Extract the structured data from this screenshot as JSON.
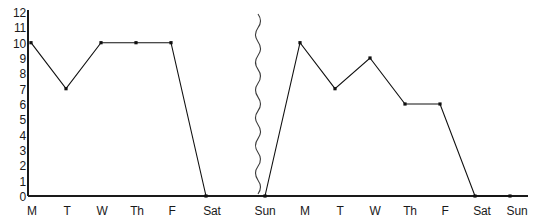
{
  "chart_data": {
    "type": "line",
    "title": "",
    "subtitle": "",
    "xlabel": "",
    "ylabel": "",
    "categories": [
      "M",
      "T",
      "W",
      "Th",
      "F",
      "Sat",
      "Sun",
      "M",
      "T",
      "W",
      "Th",
      "F",
      "Sat",
      "Sun"
    ],
    "values": [
      10,
      7,
      10,
      10,
      10,
      0,
      0,
      10,
      7,
      9,
      6,
      6,
      0,
      0
    ],
    "series": [
      {
        "name": "",
        "values": [
          10,
          7,
          10,
          10,
          10,
          0,
          0,
          10,
          7,
          9,
          6,
          6,
          0,
          0
        ]
      }
    ],
    "points": [
      {
        "x": "M",
        "y": 10
      },
      {
        "x": "T",
        "y": 7
      },
      {
        "x": "W",
        "y": 10
      },
      {
        "x": "Th",
        "y": 10
      },
      {
        "x": "F",
        "y": 10
      },
      {
        "x": "Sat",
        "y": 0
      },
      {
        "x": "Sun",
        "y": 0
      },
      {
        "x": "M",
        "y": 10
      },
      {
        "x": "T",
        "y": 7
      },
      {
        "x": "W",
        "y": 9
      },
      {
        "x": "Th",
        "y": 6
      },
      {
        "x": "F",
        "y": 6
      },
      {
        "x": "Sat",
        "y": 0
      },
      {
        "x": "Sun",
        "y": 0
      }
    ],
    "break_after_category_index": 5,
    "ylim": [
      0,
      12
    ],
    "ytick_labels": [
      "12",
      "11",
      "10",
      "9",
      "8",
      "7",
      "6",
      "5",
      "4",
      "3",
      "2",
      "1",
      "0"
    ],
    "ytick_values": [
      12,
      11,
      10,
      9,
      8,
      7,
      6,
      5,
      4,
      3,
      2,
      1,
      0
    ],
    "grid": false,
    "legend": "none",
    "marker": "square",
    "line_color": "#101010",
    "marker_color": "#101010",
    "axis_color": "#1a1a1a",
    "background_color": "#ffffff"
  },
  "axes": {
    "y_labels": [
      "12",
      "11",
      "10",
      "9",
      "8",
      "7",
      "6",
      "5",
      "4",
      "3",
      "2",
      "1",
      "0"
    ],
    "x_labels": [
      "M",
      "T",
      "W",
      "Th",
      "F",
      "Sat",
      "Sun",
      "M",
      "T",
      "W",
      "Th",
      "F",
      "Sat",
      "Sun"
    ]
  }
}
